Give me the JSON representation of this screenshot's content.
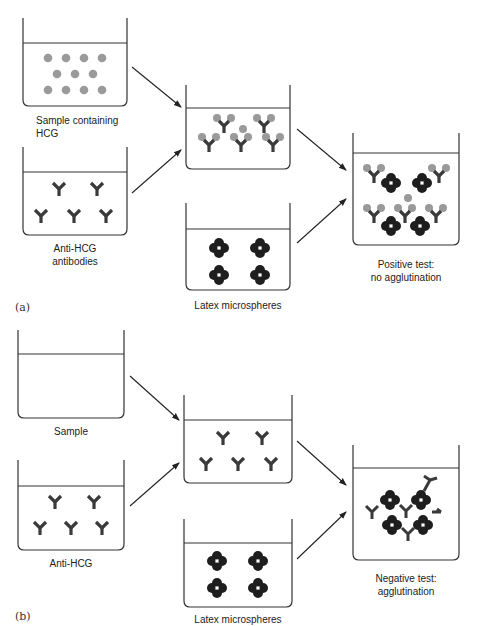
{
  "figure": {
    "panel_a": {
      "part_label": "(a)",
      "beakers": [
        {
          "id": "sample",
          "label_line1": "Sample containing",
          "label_line2": "HCG",
          "contents": "HCG molecules (gray dots)",
          "count": 11
        },
        {
          "id": "anti",
          "label_line1": "Anti-HCG",
          "label_line2": "antibodies",
          "contents": "Y-shaped antibodies",
          "count": 5
        },
        {
          "id": "mix",
          "label_line1": "",
          "label_line2": "",
          "contents": "antibodies bound to HCG",
          "count": 5
        },
        {
          "id": "latex",
          "label_line1": "Latex microspheres",
          "label_line2": "",
          "contents": "latex microsphere clusters",
          "count": 4
        },
        {
          "id": "result",
          "label_line1": "Positive test:",
          "label_line2": "no agglutination",
          "contents": "HCG-bound antibodies with free microspheres"
        }
      ]
    },
    "panel_b": {
      "part_label": "(b)",
      "beakers": [
        {
          "id": "sample",
          "label_line1": "Sample",
          "label_line2": "",
          "contents": "empty"
        },
        {
          "id": "anti",
          "label_line1": "Anti-HCG",
          "label_line2": "",
          "contents": "Y-shaped antibodies",
          "count": 5
        },
        {
          "id": "mix",
          "label_line1": "",
          "label_line2": "",
          "contents": "free antibodies",
          "count": 5
        },
        {
          "id": "latex",
          "label_line1": "Latex microspheres",
          "label_line2": "",
          "contents": "latex microsphere clusters",
          "count": 4
        },
        {
          "id": "result",
          "label_line1": "Negative test:",
          "label_line2": "agglutination",
          "contents": "agglutinated microspheres cross-linked by antibodies"
        }
      ]
    },
    "colors": {
      "hcg": "#9a9a9a",
      "antibody": "#3a3a3a",
      "microsphere": "#1e1e1e",
      "line": "#333333"
    }
  }
}
